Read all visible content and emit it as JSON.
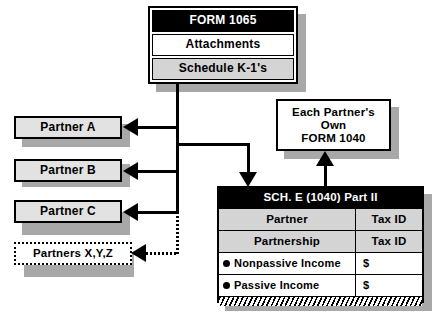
{
  "diagram": {
    "colors": {
      "header_fill": "#000000",
      "header_text": "#ffffff",
      "gray_fill": "#d4d4d4",
      "box_fill": "#e2e2e2",
      "white_fill": "#ffffff",
      "shadow": "#a8a8a8",
      "line": "#000000"
    }
  },
  "form1065": {
    "header": "FORM  1065",
    "attachments": "Attachments",
    "schedule_k1": "Schedule  K-1's"
  },
  "partners": [
    {
      "label": "Partner  A",
      "style": "solid"
    },
    {
      "label": "Partner  B",
      "style": "solid"
    },
    {
      "label": "Partner  C",
      "style": "solid"
    },
    {
      "label": "Partners  X,Y,Z",
      "style": "dotted"
    }
  ],
  "form1040": {
    "line1": "Each  Partner's",
    "line2": "Own",
    "line3": "FORM 1040"
  },
  "schedule_e": {
    "header": "SCH. E   (1040)   Part II",
    "rows": [
      {
        "left": "Partner",
        "right": "Tax  ID",
        "fill": "gray",
        "bullet": false
      },
      {
        "left": "Partnership",
        "right": "Tax  ID",
        "fill": "gray",
        "bullet": false
      },
      {
        "left": "Nonpassive Income",
        "right": "$",
        "fill": "white",
        "bullet": true
      },
      {
        "left": "Passive Income",
        "right": "$",
        "fill": "white",
        "bullet": true
      }
    ],
    "footer_band": "hatched-total-band"
  }
}
